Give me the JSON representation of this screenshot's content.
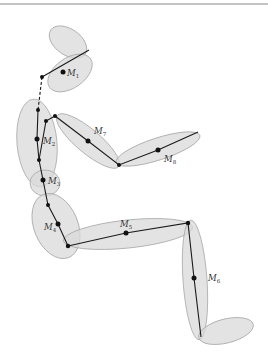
{
  "figure": {
    "title": "",
    "labels": [
      {
        "id": "M1",
        "base": "M",
        "sub": "1",
        "segment": "head"
      },
      {
        "id": "M2",
        "base": "M",
        "sub": "2",
        "segment": "upper-torso"
      },
      {
        "id": "M3",
        "base": "M",
        "sub": "3",
        "segment": "abdomen"
      },
      {
        "id": "M4",
        "base": "M",
        "sub": "4",
        "segment": "pelvis"
      },
      {
        "id": "M5",
        "base": "M",
        "sub": "5",
        "segment": "thigh"
      },
      {
        "id": "M6",
        "base": "M",
        "sub": "6",
        "segment": "shank"
      },
      {
        "id": "M7",
        "base": "M",
        "sub": "7",
        "segment": "upper-arm"
      },
      {
        "id": "M8",
        "base": "M",
        "sub": "8",
        "segment": "forearm"
      }
    ],
    "colors": {
      "segment_fill": "#d9d9d9",
      "segment_stroke": "#a8a8a8",
      "bone": "#1a1a1a",
      "label": "#333333"
    }
  }
}
